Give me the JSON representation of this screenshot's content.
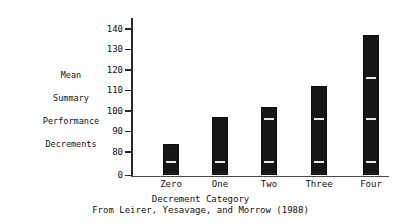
{
  "chart_data": {
    "type": "bar",
    "title": "",
    "subtitle": "",
    "categories": [
      "Zero",
      "One",
      "Two",
      "Three",
      "Four"
    ],
    "values": [
      84,
      97,
      102,
      112,
      137
    ],
    "series": [
      {
        "name": "Mean Summary Performance Decrements",
        "values": [
          84,
          97,
          102,
          112,
          137
        ]
      }
    ],
    "xlabel": "Decrement Category",
    "ylabel": "Mean Summary Performance Decrements",
    "ylabel_lines": [
      "Mean",
      "Summary",
      "Performance",
      "Decrements"
    ],
    "ytick_labels": [
      "140",
      "130",
      "120",
      "110",
      "100",
      "90",
      "80",
      "0"
    ],
    "ytick_values": [
      140,
      130,
      120,
      110,
      100,
      90,
      80,
      0
    ],
    "ylim": [
      0,
      145
    ],
    "axis_break": true,
    "grid": false,
    "legend": null,
    "annotation": "From Leirer, Yesavage, and Morrow (1988)",
    "bar_color": "#161616",
    "axis_color": "#2a2a2a",
    "marker_color": "#e8e8e8",
    "internal_markers": [
      {
        "category": "Zero",
        "values": [
          76
        ]
      },
      {
        "category": "One",
        "values": [
          76
        ]
      },
      {
        "category": "Two",
        "values": [
          76,
          97
        ]
      },
      {
        "category": "Three",
        "values": [
          76,
          97
        ]
      },
      {
        "category": "Four",
        "values": [
          76,
          97,
          117
        ]
      }
    ]
  }
}
